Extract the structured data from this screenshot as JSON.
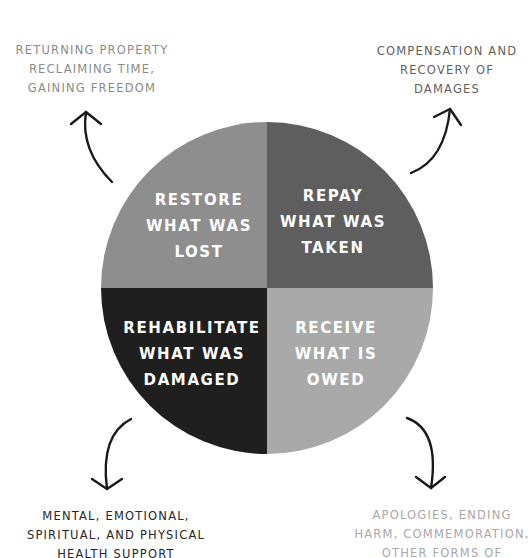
{
  "diagram": {
    "type": "four-quadrant circle",
    "center": {
      "x": 267,
      "y": 288
    },
    "radius": 166,
    "quadrants": [
      {
        "id": "restore",
        "position": "top-left",
        "fill": "#8e8e8e",
        "lines": [
          "RESTORE",
          "WHAT WAS",
          "LOST"
        ],
        "label_center_x": 199,
        "label_top_y": 187,
        "outer": {
          "lines": [
            "RETURNING PROPERTY",
            "RECLAIMING TIME,",
            "GAINING FREEDOM"
          ],
          "color": "#8a8a8a",
          "center_x": 92,
          "top_y": 41
        },
        "arrow": {
          "tail": [
            112,
            182
          ],
          "ctrl": [
            80,
            150
          ],
          "tip": [
            86,
            112
          ],
          "arm1": [
            71,
            124
          ],
          "arm2": [
            101,
            124
          ]
        }
      },
      {
        "id": "repay",
        "position": "top-right",
        "fill": "#5e5e5e",
        "lines": [
          "REPAY",
          "WHAT WAS",
          "TAKEN"
        ],
        "label_center_x": 333,
        "label_top_y": 183,
        "outer": {
          "lines": [
            "COMPENSATION AND",
            "RECOVERY OF",
            "DAMAGES"
          ],
          "color": "#5f5f5f",
          "center_x": 447,
          "top_y": 42
        },
        "arrow": {
          "tail": [
            411,
            173
          ],
          "ctrl": [
            445,
            160
          ],
          "tip": [
            450,
            109
          ],
          "arm1": [
            434,
            117
          ],
          "arm2": [
            461,
            125
          ]
        }
      },
      {
        "id": "rehabilitate",
        "position": "bottom-left",
        "fill": "#1f1f1f",
        "lines": [
          "REHABILITATE",
          "WHAT WAS",
          "DAMAGED"
        ],
        "label_center_x": 192,
        "label_top_y": 315,
        "outer": {
          "lines": [
            "MENTAL, EMOTIONAL,",
            "SPIRITUAL, AND PHYSICAL",
            "HEALTH SUPPORT"
          ],
          "color": "#262626",
          "center_x": 116,
          "top_y": 507
        },
        "arrow": {
          "tail": [
            131,
            419
          ],
          "ctrl": [
            100,
            435
          ],
          "tip": [
            107,
            489
          ],
          "arm1": [
            92,
            479
          ],
          "arm2": [
            122,
            479
          ]
        }
      },
      {
        "id": "receive",
        "position": "bottom-right",
        "fill": "#a9a9a9",
        "lines": [
          "RECEIVE",
          "WHAT IS",
          "OWED"
        ],
        "label_center_x": 336,
        "label_top_y": 315,
        "outer": {
          "lines": [
            "APOLOGIES, ENDING",
            "HARM, COMMEMORATION,",
            "OTHER FORMS OF"
          ],
          "color": "#a8a8a8",
          "center_x": 442,
          "top_y": 506
        },
        "arrow": {
          "tail": [
            407,
            418
          ],
          "ctrl": [
            440,
            430
          ],
          "tip": [
            431,
            488
          ],
          "arm1": [
            416,
            477
          ],
          "arm2": [
            445,
            477
          ]
        }
      }
    ],
    "arrow_color": "#1a1a1a"
  }
}
